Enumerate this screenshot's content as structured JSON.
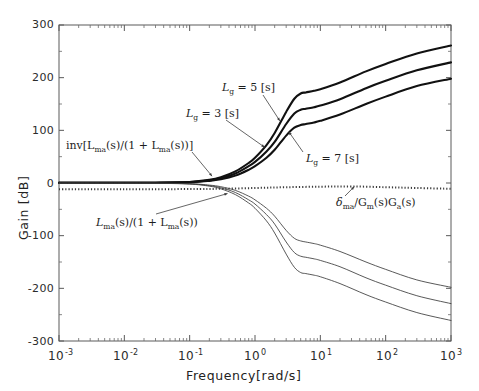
{
  "figure": {
    "width": 479,
    "height": 391,
    "background": "#ffffff"
  },
  "chart_data": {
    "type": "line",
    "title": "",
    "xlabel": "Frequency[rad/s]",
    "ylabel": "Gain [dB]",
    "xscale": "log",
    "xlim": [
      0.001,
      1000
    ],
    "ylim": [
      -300,
      300
    ],
    "grid": false,
    "legend": "none (inline annotations)",
    "xticks": [
      0.001,
      0.01,
      0.1,
      1,
      10,
      100,
      1000
    ],
    "xticklabels": [
      "10-3",
      "10-2",
      "10-1",
      "100",
      "101",
      "102",
      "103"
    ],
    "yticks": [
      300,
      200,
      100,
      0,
      -100,
      -200,
      -300
    ],
    "yticklabels": [
      "300",
      "200",
      "100",
      "0",
      "-100",
      "-200",
      "-300"
    ],
    "series": [
      {
        "name": "inv[Lma(s)/(1+Lma(s))], Lg = 3 [s]",
        "style": "solid-thick",
        "color": "#111111",
        "x": [
          0.001,
          0.01,
          0.03,
          0.1,
          0.2,
          0.3,
          0.5,
          0.8,
          1.0,
          1.5,
          2.0,
          3.0,
          4.0,
          5.0,
          6.0,
          8.0,
          10.0,
          20.0,
          50.0,
          100.0,
          300.0,
          1000.0
        ],
        "y": [
          0.3,
          0.4,
          0.6,
          2.0,
          6.0,
          11.0,
          22.0,
          38.0,
          48.0,
          72.0,
          95.0,
          135.0,
          160.0,
          170.0,
          172.0,
          175.0,
          178.0,
          191.0,
          212.0,
          226.0,
          246.0,
          261.0
        ]
      },
      {
        "name": "inv[Lma(s)/(1+Lma(s))], Lg = 5 [s]",
        "style": "solid-thick",
        "color": "#111111",
        "x": [
          0.001,
          0.01,
          0.03,
          0.1,
          0.2,
          0.3,
          0.5,
          0.8,
          1.0,
          1.5,
          2.0,
          3.0,
          4.0,
          5.0,
          6.0,
          8.0,
          10.0,
          20.0,
          50.0,
          100.0,
          300.0,
          1000.0
        ],
        "y": [
          0.3,
          0.4,
          0.5,
          1.6,
          5.0,
          9.0,
          18.0,
          32.0,
          40.0,
          60.0,
          78.0,
          112.0,
          132.0,
          139.0,
          141.0,
          144.0,
          147.0,
          159.0,
          180.0,
          194.0,
          214.0,
          229.0
        ]
      },
      {
        "name": "inv[Lma(s)/(1+Lma(s))], Lg = 7 [s]",
        "style": "solid-thick",
        "color": "#111111",
        "x": [
          0.001,
          0.01,
          0.03,
          0.1,
          0.2,
          0.3,
          0.5,
          0.8,
          1.0,
          1.5,
          2.0,
          3.0,
          4.0,
          5.0,
          6.0,
          8.0,
          10.0,
          20.0,
          50.0,
          100.0,
          300.0,
          1000.0
        ],
        "y": [
          0.3,
          0.4,
          0.5,
          1.3,
          4.0,
          7.0,
          14.0,
          25.0,
          32.0,
          48.0,
          63.0,
          90.0,
          105.0,
          110.0,
          112.0,
          115.0,
          118.0,
          130.0,
          150.0,
          164.0,
          184.0,
          198.0
        ]
      },
      {
        "name": "Lma(s)/(1+Lma(s)), Lg = 3 [s]",
        "style": "solid-thin",
        "color": "#3b3b3b",
        "x": [
          0.001,
          0.01,
          0.03,
          0.1,
          0.2,
          0.3,
          0.5,
          0.8,
          1.0,
          1.5,
          2.0,
          3.0,
          4.0,
          5.0,
          6.0,
          8.0,
          10.0,
          20.0,
          50.0,
          100.0,
          300.0,
          1000.0
        ],
        "y": [
          -0.3,
          -0.4,
          -0.6,
          -2.0,
          -6.0,
          -11.0,
          -22.0,
          -38.0,
          -48.0,
          -72.0,
          -95.0,
          -135.0,
          -160.0,
          -170.0,
          -172.0,
          -175.0,
          -178.0,
          -191.0,
          -212.0,
          -226.0,
          -246.0,
          -261.0
        ]
      },
      {
        "name": "Lma(s)/(1+Lma(s)), Lg = 5 [s]",
        "style": "solid-thin",
        "color": "#3b3b3b",
        "x": [
          0.001,
          0.01,
          0.03,
          0.1,
          0.2,
          0.3,
          0.5,
          0.8,
          1.0,
          1.5,
          2.0,
          3.0,
          4.0,
          5.0,
          6.0,
          8.0,
          10.0,
          20.0,
          50.0,
          100.0,
          300.0,
          1000.0
        ],
        "y": [
          -0.3,
          -0.4,
          -0.5,
          -1.6,
          -5.0,
          -9.0,
          -18.0,
          -32.0,
          -40.0,
          -60.0,
          -78.0,
          -112.0,
          -132.0,
          -139.0,
          -141.0,
          -144.0,
          -147.0,
          -159.0,
          -180.0,
          -194.0,
          -214.0,
          -229.0
        ]
      },
      {
        "name": "Lma(s)/(1+Lma(s)), Lg = 7 [s]",
        "style": "solid-thin",
        "color": "#3b3b3b",
        "x": [
          0.001,
          0.01,
          0.03,
          0.1,
          0.2,
          0.3,
          0.5,
          0.8,
          1.0,
          1.5,
          2.0,
          3.0,
          4.0,
          5.0,
          6.0,
          8.0,
          10.0,
          20.0,
          50.0,
          100.0,
          300.0,
          1000.0
        ],
        "y": [
          -0.3,
          -0.4,
          -0.5,
          -1.3,
          -4.0,
          -7.0,
          -14.0,
          -25.0,
          -32.0,
          -48.0,
          -63.0,
          -90.0,
          -105.0,
          -110.0,
          -112.0,
          -115.0,
          -118.0,
          -130.0,
          -150.0,
          -164.0,
          -184.0,
          -198.0
        ]
      },
      {
        "name": "delta_ma/Gm(s)Ga(s)",
        "style": "dotted",
        "color": "#3a3a3a",
        "x": [
          0.001,
          0.01,
          0.1,
          0.3,
          1.0,
          3.0,
          10.0,
          30.0,
          100.0,
          300.0,
          1000.0
        ],
        "y": [
          -12.0,
          -12.0,
          -11.5,
          -11.0,
          -9.5,
          -8.0,
          -7.0,
          -6.5,
          -8.0,
          -9.5,
          -11.0
        ]
      }
    ],
    "annotations": [
      {
        "id": "lg5",
        "text": "Lg = 5 [s]",
        "target_x": 2.4,
        "target_y": 118
      },
      {
        "id": "lg3",
        "text": "Lg = 3 [s]",
        "target_x": 1.4,
        "target_y": 68
      },
      {
        "id": "lg7",
        "text": "Lg = 7 [s]",
        "target_x": 3.3,
        "target_y": 97
      },
      {
        "id": "inv",
        "text": "inv[Lma(s)/(1 + Lma(s))]",
        "target_x": 0.22,
        "target_y": 13
      },
      {
        "id": "lma",
        "text": "Lma(s)/(1 + Lma(s))",
        "target_x": 0.38,
        "target_y": -20
      },
      {
        "id": "delta",
        "text": "delta_ma/Gm(s)Ga(s)",
        "target_x": 33,
        "target_y": -7
      }
    ]
  },
  "axes": {
    "y_title": "Gain [dB]",
    "x_title": "Frequency[rad/s]",
    "y_ticks": [
      {
        "label": "300",
        "value": 300
      },
      {
        "label": "200",
        "value": 200
      },
      {
        "label": "100",
        "value": 100
      },
      {
        "label": "0",
        "value": 0
      },
      {
        "label": "-100",
        "value": -100
      },
      {
        "label": "-200",
        "value": -200
      },
      {
        "label": "-300",
        "value": -300
      }
    ],
    "x_ticks": [
      {
        "base": "10",
        "exp": "-3",
        "value": 0.001
      },
      {
        "base": "10",
        "exp": "-2",
        "value": 0.01
      },
      {
        "base": "10",
        "exp": "-1",
        "value": 0.1
      },
      {
        "base": "10",
        "exp": "0",
        "value": 1
      },
      {
        "base": "10",
        "exp": "1",
        "value": 10
      },
      {
        "base": "10",
        "exp": "2",
        "value": 100
      },
      {
        "base": "10",
        "exp": "3",
        "value": 1000
      }
    ]
  },
  "annotations": {
    "lg5": {
      "lead": "L",
      "sub": "g",
      "rest": " = 5 [s]"
    },
    "lg3": {
      "lead": "L",
      "sub": "g",
      "rest": " = 3 [s]"
    },
    "lg7": {
      "lead": "L",
      "sub": "g",
      "rest": " = 7 [s]"
    },
    "inv_text": "inv[L",
    "inv_sub": "ma",
    "inv_mid": "(s)/(1 + L",
    "inv_sub2": "ma",
    "inv_end": "(s))]",
    "lma_text": "L",
    "lma_sub": "ma",
    "lma_mid": "(s)/(1 + L",
    "lma_sub2": "ma",
    "lma_end": "(s))",
    "delta_lead": "δ",
    "delta_sub": "ma",
    "delta_mid": "/G",
    "delta_sub2": "m",
    "delta_mid2": "(s)G",
    "delta_sub3": "a",
    "delta_end": "(s)"
  }
}
